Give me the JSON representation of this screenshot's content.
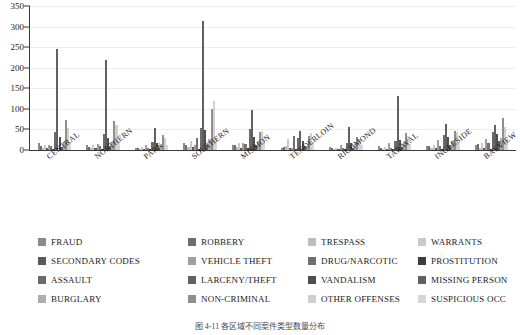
{
  "chart_data": {
    "type": "bar",
    "title": "",
    "xlabel": "",
    "ylabel": "",
    "ylim": [
      0,
      350
    ],
    "ytick_values": [
      0,
      50,
      100,
      150,
      200,
      250,
      300,
      350
    ],
    "grid": true,
    "legend_position": "bottom",
    "categories": [
      "CENTRAL",
      "NORTHERN",
      "PARK",
      "SOUTHERN",
      "MISSION",
      "TENDERLOIN",
      "RICHMOND",
      "TARAVAL",
      "INGLESIDE",
      "BAYVIEW"
    ],
    "series": [
      {
        "name": "FRAUD",
        "color": "#8a8a8a",
        "values": [
          16,
          12,
          6,
          17,
          13,
          5,
          8,
          10,
          9,
          11
        ]
      },
      {
        "name": "ROBBERY",
        "color": "#6e6e6e",
        "values": [
          9,
          8,
          4,
          13,
          11,
          7,
          4,
          5,
          9,
          14
        ]
      },
      {
        "name": "TRESPASS",
        "color": "#bdbdbd",
        "values": [
          6,
          5,
          3,
          8,
          7,
          9,
          2,
          3,
          4,
          5
        ]
      },
      {
        "name": "WARRANTS",
        "color": "#c9c9c9",
        "values": [
          13,
          11,
          7,
          22,
          16,
          27,
          5,
          7,
          12,
          18
        ]
      },
      {
        "name": "SECONDARY CODES",
        "color": "#5a5a5a",
        "values": [
          5,
          4,
          3,
          7,
          6,
          4,
          2,
          3,
          4,
          6
        ]
      },
      {
        "name": "VEHICLE THEFT",
        "color": "#9e9e9e",
        "values": [
          12,
          14,
          11,
          13,
          17,
          4,
          11,
          16,
          24,
          26
        ]
      },
      {
        "name": "DRUG/NARCOTIC",
        "color": "#707070",
        "values": [
          10,
          9,
          6,
          29,
          14,
          35,
          4,
          5,
          10,
          17
        ]
      },
      {
        "name": "PROSTITUTION",
        "color": "#3d3d3d",
        "values": [
          2,
          3,
          1,
          2,
          6,
          3,
          1,
          1,
          2,
          2
        ]
      },
      {
        "name": "ASSAULT",
        "color": "#6b6b6b",
        "values": [
          44,
          38,
          20,
          54,
          50,
          30,
          18,
          23,
          36,
          45
        ]
      },
      {
        "name": "LARCENY/THEFT",
        "color": "#606060",
        "values": [
          246,
          219,
          54,
          313,
          97,
          46,
          56,
          131,
          63,
          61
        ]
      },
      {
        "name": "VANDALISM",
        "color": "#4f4f4f",
        "values": [
          31,
          30,
          18,
          49,
          32,
          21,
          17,
          25,
          31,
          38
        ]
      },
      {
        "name": "MISSING PERSON",
        "color": "#5f5f5f",
        "values": [
          8,
          9,
          6,
          12,
          13,
          10,
          6,
          8,
          13,
          21
        ]
      },
      {
        "name": "BURGLARY",
        "color": "#adadad",
        "values": [
          20,
          19,
          15,
          27,
          22,
          9,
          15,
          17,
          22,
          30
        ]
      },
      {
        "name": "NON-CRIMINAL",
        "color": "#8f8f8f",
        "values": [
          74,
          70,
          36,
          99,
          44,
          34,
          31,
          42,
          46,
          79
        ]
      },
      {
        "name": "OTHER OFFENSES",
        "color": "#cfcfcf",
        "values": [
          53,
          60,
          29,
          118,
          47,
          41,
          26,
          33,
          44,
          57
        ]
      },
      {
        "name": "SUSPICIOUS OCC",
        "color": "#d6d6d6",
        "values": [
          18,
          21,
          12,
          30,
          22,
          19,
          11,
          14,
          18,
          24
        ]
      }
    ]
  },
  "legend": {
    "entries": [
      {
        "label": "FRAUD",
        "color": "#8a8a8a"
      },
      {
        "label": "ROBBERY",
        "color": "#6e6e6e"
      },
      {
        "label": "TRESPASS",
        "color": "#bdbdbd"
      },
      {
        "label": "WARRANTS",
        "color": "#c9c9c9"
      },
      {
        "label": "SECONDARY CODES",
        "color": "#5a5a5a"
      },
      {
        "label": "VEHICLE THEFT",
        "color": "#9e9e9e"
      },
      {
        "label": "DRUG/NARCOTIC",
        "color": "#707070"
      },
      {
        "label": "PROSTITUTION",
        "color": "#3d3d3d"
      },
      {
        "label": "ASSAULT",
        "color": "#6b6b6b"
      },
      {
        "label": "LARCENY/THEFT",
        "color": "#606060"
      },
      {
        "label": "VANDALISM",
        "color": "#4f4f4f"
      },
      {
        "label": "MISSING PERSON",
        "color": "#5f5f5f"
      },
      {
        "label": "BURGLARY",
        "color": "#adadad"
      },
      {
        "label": "NON-CRIMINAL",
        "color": "#8f8f8f"
      },
      {
        "label": "OTHER OFFENSES",
        "color": "#cfcfcf"
      },
      {
        "label": "SUSPICIOUS OCC",
        "color": "#d6d6d6"
      }
    ]
  },
  "caption": {
    "text": "图 4-11   各区域不同案件类型数量分布"
  }
}
